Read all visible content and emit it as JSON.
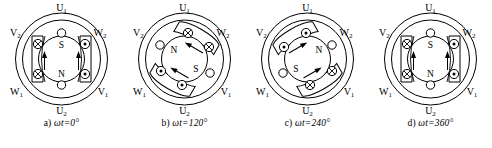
{
  "figure": {
    "background_color": "#ffffff",
    "line_color": "#000000"
  },
  "terminals": {
    "top": "U₁",
    "upper_right": "W₂",
    "lower_right": "V₁",
    "bottom": "U₂",
    "lower_left": "W₁",
    "upper_left": "V₂"
  },
  "poles": {
    "north": "N",
    "south": "S"
  },
  "symbols": {
    "current_into_page": "⊗",
    "current_out_of_page": "⊙",
    "current_zero": "○"
  },
  "panels": [
    {
      "id": "panel-a",
      "caption_index": "a)",
      "caption_expr": "ωt=0°",
      "caption": "a)  ωt=0°",
      "angle_deg": 0,
      "field_axis_deg": 0,
      "north_position": "bottom",
      "south_position": "top",
      "coils": [
        {
          "slot": "top",
          "state": "zero"
        },
        {
          "slot": "upper_right",
          "state": "out_of_page"
        },
        {
          "slot": "lower_right",
          "state": "out_of_page"
        },
        {
          "slot": "bottom",
          "state": "zero"
        },
        {
          "slot": "lower_left",
          "state": "into_page"
        },
        {
          "slot": "upper_left",
          "state": "into_page"
        }
      ]
    },
    {
      "id": "panel-b",
      "caption_index": "b)",
      "caption_expr": "ωt=120°",
      "caption": "b)  ωt=120°",
      "angle_deg": 120,
      "field_axis_deg": 120,
      "north_position": "upper-left",
      "south_position": "lower-right",
      "coils": [
        {
          "slot": "top",
          "state": "into_page"
        },
        {
          "slot": "upper_right",
          "state": "into_page"
        },
        {
          "slot": "lower_right",
          "state": "zero"
        },
        {
          "slot": "bottom",
          "state": "out_of_page"
        },
        {
          "slot": "lower_left",
          "state": "out_of_page"
        },
        {
          "slot": "upper_left",
          "state": "zero"
        }
      ]
    },
    {
      "id": "panel-c",
      "caption_index": "c)",
      "caption_expr": "ωt=240°",
      "caption": "c)  ωt=240°",
      "angle_deg": 240,
      "field_axis_deg": 240,
      "north_position": "upper-right",
      "south_position": "lower-left",
      "coils": [
        {
          "slot": "top",
          "state": "out_of_page"
        },
        {
          "slot": "upper_right",
          "state": "zero"
        },
        {
          "slot": "lower_right",
          "state": "into_page"
        },
        {
          "slot": "bottom",
          "state": "into_page"
        },
        {
          "slot": "lower_left",
          "state": "zero"
        },
        {
          "slot": "upper_left",
          "state": "out_of_page"
        }
      ]
    },
    {
      "id": "panel-d",
      "caption_index": "d)",
      "caption_expr": "ωt=360°",
      "caption": "d)  ωt=360°",
      "angle_deg": 360,
      "field_axis_deg": 0,
      "north_position": "bottom",
      "south_position": "top",
      "coils": [
        {
          "slot": "top",
          "state": "zero"
        },
        {
          "slot": "upper_right",
          "state": "out_of_page"
        },
        {
          "slot": "lower_right",
          "state": "out_of_page"
        },
        {
          "slot": "bottom",
          "state": "zero"
        },
        {
          "slot": "lower_left",
          "state": "into_page"
        },
        {
          "slot": "upper_left",
          "state": "into_page"
        }
      ]
    }
  ]
}
